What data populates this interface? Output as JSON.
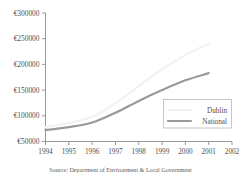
{
  "chart_data": {
    "type": "line",
    "title": "",
    "subtitle": "",
    "xlabel": "",
    "ylabel": "",
    "x": [
      1994,
      1995,
      1996,
      1997,
      1998,
      1999,
      2000,
      2001,
      2002
    ],
    "categories": [
      "1994",
      "1995",
      "1996",
      "1997",
      "1998",
      "1999",
      "2000",
      "2001",
      "2002"
    ],
    "xlim": [
      1994,
      2002
    ],
    "ylim": [
      50000,
      300000
    ],
    "ytick_values": [
      50000,
      100000,
      150000,
      200000,
      250000,
      300000
    ],
    "ytick_labels": [
      "€50000",
      "€100000",
      "€150000",
      "€200000",
      "€250000",
      "€300000"
    ],
    "grid": false,
    "legend_position": "lower-right",
    "series": [
      {
        "name": "Dublin",
        "color": "#f2f2f2",
        "x": [
          1994,
          1995,
          1996,
          1997,
          1998,
          1999,
          2000,
          2001
        ],
        "values": [
          78000,
          86000,
          98000,
          124000,
          158000,
          190000,
          218000,
          240000
        ]
      },
      {
        "name": "National",
        "color": "#9a9a9a",
        "x": [
          1994,
          1995,
          1996,
          1997,
          1998,
          1999,
          2000,
          2001
        ],
        "values": [
          72000,
          78000,
          87000,
          106000,
          129000,
          150000,
          169000,
          183000
        ]
      }
    ],
    "annotations": []
  },
  "legend": {
    "items": [
      {
        "label": "Dublin",
        "color": "#f2f2f2"
      },
      {
        "label": "National",
        "color": "#9a9a9a"
      }
    ]
  },
  "source": {
    "text": "Source: Department of Environment & Local Government"
  }
}
